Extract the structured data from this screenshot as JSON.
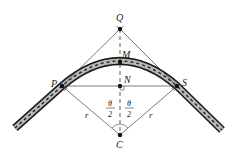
{
  "diagram": {
    "points": {
      "Q": {
        "label": "Q",
        "x": 120,
        "y": 29
      },
      "M": {
        "label": "M",
        "x": 120,
        "y": 62
      },
      "N": {
        "label": "N",
        "x": 120,
        "y": 86
      },
      "P": {
        "label": "P",
        "x": 62,
        "y": 86
      },
      "S": {
        "label": "S",
        "x": 177,
        "y": 86
      },
      "C": {
        "label": "C",
        "x": 120,
        "y": 135
      }
    },
    "labels": {
      "radius_left": "r",
      "radius_right": "r",
      "theta": "θ",
      "two": "2"
    },
    "colors": {
      "line": "#333333",
      "road_edge": "#1a1a1a",
      "road_fill": "#b8b8b8",
      "dash": "#1a1a1a"
    }
  }
}
